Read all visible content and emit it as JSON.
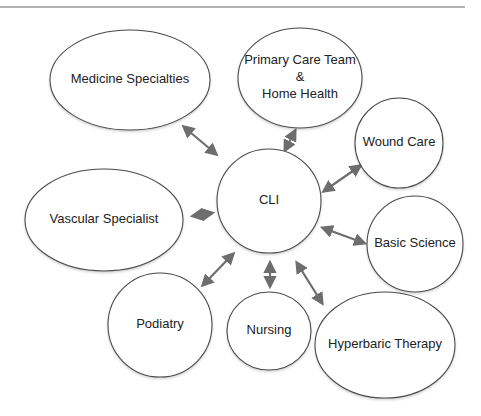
{
  "diagram": {
    "type": "hub-and-spoke",
    "center": {
      "id": "cli",
      "label": "CLI",
      "cx": 269,
      "cy": 201,
      "rx": 52,
      "ry": 52
    },
    "nodes": [
      {
        "id": "medicine-specialties",
        "lines": [
          "Medicine Specialties"
        ],
        "cx": 130,
        "cy": 80,
        "rx": 80,
        "ry": 50
      },
      {
        "id": "primary-care-team-home-health",
        "lines": [
          "Primary Care Team",
          "&",
          "Home Health"
        ],
        "cx": 300,
        "cy": 78,
        "rx": 62,
        "ry": 50
      },
      {
        "id": "wound-care",
        "lines": [
          "Wound Care"
        ],
        "cx": 399,
        "cy": 143,
        "rx": 44,
        "ry": 45
      },
      {
        "id": "vascular-specialist",
        "lines": [
          "Vascular Specialist"
        ],
        "cx": 104,
        "cy": 220,
        "rx": 79,
        "ry": 51
      },
      {
        "id": "basic-science",
        "lines": [
          "Basic Science"
        ],
        "cx": 415,
        "cy": 244,
        "rx": 48,
        "ry": 48
      },
      {
        "id": "podiatry",
        "lines": [
          "Podiatry"
        ],
        "cx": 160,
        "cy": 325,
        "rx": 52,
        "ry": 52
      },
      {
        "id": "nursing",
        "lines": [
          "Nursing"
        ],
        "cx": 269,
        "cy": 331,
        "rx": 42,
        "ry": 39
      },
      {
        "id": "hyperbaric-therapy",
        "lines": [
          "Hyperbaric Therapy"
        ],
        "cx": 385,
        "cy": 345,
        "rx": 70,
        "ry": 53
      }
    ],
    "edges": [
      {
        "from": "cli",
        "to": "medicine-specialties",
        "x1": 216,
        "y1": 154,
        "x2": 184,
        "y2": 127,
        "direction": "bidirectional"
      },
      {
        "from": "cli",
        "to": "primary-care-team-home-health",
        "x1": 285,
        "y1": 150,
        "x2": 295,
        "y2": 131,
        "direction": "bidirectional"
      },
      {
        "from": "cli",
        "to": "wound-care",
        "x1": 324,
        "y1": 191,
        "x2": 360,
        "y2": 166,
        "direction": "bidirectional"
      },
      {
        "from": "cli",
        "to": "vascular-specialist",
        "x1": 193,
        "y1": 216,
        "x2": 212,
        "y2": 213,
        "direction": "bidirectional"
      },
      {
        "from": "cli",
        "to": "basic-science",
        "x1": 323,
        "y1": 228,
        "x2": 364,
        "y2": 243,
        "direction": "bidirectional"
      },
      {
        "from": "cli",
        "to": "podiatry",
        "x1": 233,
        "y1": 254,
        "x2": 203,
        "y2": 285,
        "direction": "bidirectional"
      },
      {
        "from": "cli",
        "to": "nursing",
        "x1": 270,
        "y1": 263,
        "x2": 270,
        "y2": 286,
        "direction": "bidirectional"
      },
      {
        "from": "cli",
        "to": "hyperbaric-therapy",
        "x1": 297,
        "y1": 263,
        "x2": 322,
        "y2": 303,
        "direction": "bidirectional"
      }
    ]
  },
  "style": {
    "node_stroke": "#4a4a4a",
    "node_fill": "#ffffff",
    "edge_color": "#6d6d6d",
    "text_color": "#222222",
    "rule_color": "#9a9a9a"
  }
}
